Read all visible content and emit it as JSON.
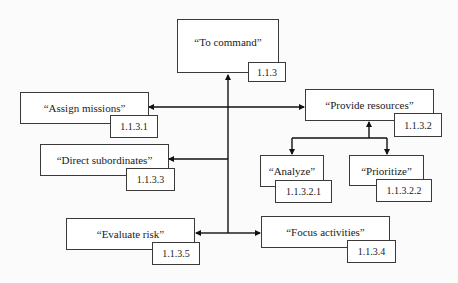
{
  "diagram": {
    "nodes": [
      {
        "id": "root",
        "label": "“To command”",
        "code": "1.1.3"
      },
      {
        "id": "n1",
        "label": "“Assign missions”",
        "code": "1.1.3.1"
      },
      {
        "id": "n2",
        "label": "“Provide resources”",
        "code": "1.1.3.2"
      },
      {
        "id": "n3",
        "label": "“Direct subordinates”",
        "code": "1.1.3.3"
      },
      {
        "id": "n21",
        "label": "“Analyze”",
        "code": "1.1.3.2.1"
      },
      {
        "id": "n22",
        "label": "“Prioritize”",
        "code": "1.1.3.2.2"
      },
      {
        "id": "n5",
        "label": "“Evaluate risk”",
        "code": "1.1.3.5"
      },
      {
        "id": "n4",
        "label": "“Focus activities”",
        "code": "1.1.3.4"
      }
    ],
    "edges": [
      {
        "from": "root",
        "to": "n1"
      },
      {
        "from": "root",
        "to": "n2"
      },
      {
        "from": "root",
        "to": "n3"
      },
      {
        "from": "root",
        "to": "n4"
      },
      {
        "from": "root",
        "to": "n5"
      },
      {
        "from": "n2",
        "to": "n21"
      },
      {
        "from": "n2",
        "to": "n22"
      }
    ],
    "colors": {
      "line": "#111111",
      "box_border": "#3a3a3a",
      "background": "#fbfbfb"
    }
  }
}
